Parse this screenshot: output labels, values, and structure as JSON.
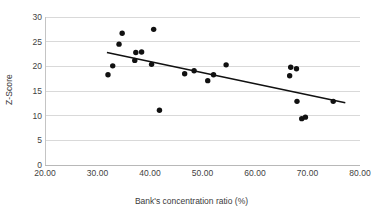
{
  "chart_data": {
    "type": "scatter",
    "title": "",
    "xlabel": "Bank's concentration ratio (%)",
    "ylabel": "Z-Score",
    "xlim": [
      20,
      80
    ],
    "ylim": [
      0,
      30
    ],
    "xticks": [
      "20.00",
      "30.00",
      "40.00",
      "50.00",
      "60.00",
      "70.00",
      "80.00"
    ],
    "xtick_values": [
      20,
      30,
      40,
      50,
      60,
      70,
      80
    ],
    "yticks": [
      "0",
      "5",
      "10",
      "15",
      "20",
      "25",
      "30"
    ],
    "ytick_values": [
      0,
      5,
      10,
      15,
      20,
      25,
      30
    ],
    "grid": "horizontal",
    "legend": "none",
    "marker_color": "#111111",
    "trendline_color": "#111111",
    "gridline_color": "#d9d9d9",
    "points": [
      {
        "x": 32.0,
        "y": 18.3
      },
      {
        "x": 32.9,
        "y": 20.1
      },
      {
        "x": 34.1,
        "y": 24.5
      },
      {
        "x": 34.7,
        "y": 26.7
      },
      {
        "x": 37.1,
        "y": 21.2
      },
      {
        "x": 37.3,
        "y": 22.8
      },
      {
        "x": 38.4,
        "y": 22.9
      },
      {
        "x": 40.3,
        "y": 20.4
      },
      {
        "x": 40.7,
        "y": 27.5
      },
      {
        "x": 41.8,
        "y": 11.1
      },
      {
        "x": 46.6,
        "y": 18.5
      },
      {
        "x": 48.4,
        "y": 19.1
      },
      {
        "x": 51.0,
        "y": 17.1
      },
      {
        "x": 52.1,
        "y": 18.3
      },
      {
        "x": 54.5,
        "y": 20.3
      },
      {
        "x": 66.6,
        "y": 18.1
      },
      {
        "x": 66.8,
        "y": 19.8
      },
      {
        "x": 67.9,
        "y": 19.5
      },
      {
        "x": 68.0,
        "y": 12.9
      },
      {
        "x": 68.9,
        "y": 9.4
      },
      {
        "x": 69.6,
        "y": 9.7
      },
      {
        "x": 74.9,
        "y": 12.9
      }
    ],
    "trendline": {
      "x1": 31.8,
      "y1": 22.8,
      "x2": 77.2,
      "y2": 12.6
    }
  }
}
